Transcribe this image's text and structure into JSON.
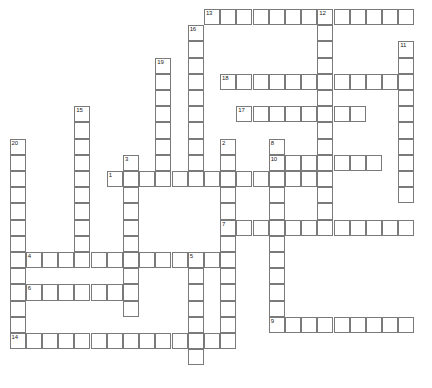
{
  "puzzle": {
    "title": "Crossword Puzzle Grid",
    "kind": "empty-crossword-grid",
    "grid": {
      "cell_size": 16.2,
      "origin_x": 9.5,
      "origin_y": 9.0,
      "columns": 26,
      "rows": 23,
      "border_color": "#7a7a7a",
      "cell_fill": "#ffffff",
      "page_background": "#ffffff",
      "number_color": "#1a1a1a"
    },
    "entries": [
      {
        "number": "1",
        "direction": "across",
        "row": 11,
        "col": 7,
        "length": 13
      },
      {
        "number": "2",
        "direction": "down",
        "row": 9,
        "col": 14,
        "length": 13
      },
      {
        "number": "3",
        "direction": "down",
        "row": 10,
        "col": 8,
        "length": 10
      },
      {
        "number": "4",
        "direction": "across",
        "row": 16,
        "col": 2,
        "length": 12
      },
      {
        "number": "5",
        "direction": "down",
        "row": 16,
        "col": 12,
        "length": 7
      },
      {
        "number": "6",
        "direction": "across",
        "row": 18,
        "col": 2,
        "length": 7
      },
      {
        "number": "7",
        "direction": "across",
        "row": 14,
        "col": 14,
        "length": 12
      },
      {
        "number": "8",
        "direction": "down",
        "row": 9,
        "col": 17,
        "length": 12
      },
      {
        "number": "9",
        "direction": "across",
        "row": 20,
        "col": 17,
        "length": 9
      },
      {
        "number": "10",
        "direction": "across",
        "row": 10,
        "col": 17,
        "length": 7
      },
      {
        "number": "11",
        "direction": "down",
        "row": 3,
        "col": 25,
        "length": 10
      },
      {
        "number": "12",
        "direction": "down",
        "row": 1,
        "col": 20,
        "length": 14
      },
      {
        "number": "13",
        "direction": "across",
        "row": 1,
        "col": 13,
        "length": 13
      },
      {
        "number": "14",
        "direction": "across",
        "row": 21,
        "col": 1,
        "length": 13
      },
      {
        "number": "15",
        "direction": "down",
        "row": 7,
        "col": 5,
        "length": 10
      },
      {
        "number": "16",
        "direction": "down",
        "row": 2,
        "col": 12,
        "length": 10
      },
      {
        "number": "17",
        "direction": "across",
        "row": 7,
        "col": 15,
        "length": 8
      },
      {
        "number": "18",
        "direction": "across",
        "row": 5,
        "col": 14,
        "length": 11
      },
      {
        "number": "19",
        "direction": "down",
        "row": 4,
        "col": 10,
        "length": 8
      },
      {
        "number": "20",
        "direction": "down",
        "row": 9,
        "col": 1,
        "length": 13
      }
    ],
    "numbered_labels": [
      "1",
      "2",
      "3",
      "4",
      "5",
      "6",
      "7",
      "8",
      "9",
      "10",
      "11",
      "12",
      "13",
      "14",
      "15",
      "16",
      "17",
      "18",
      "19",
      "20"
    ]
  }
}
